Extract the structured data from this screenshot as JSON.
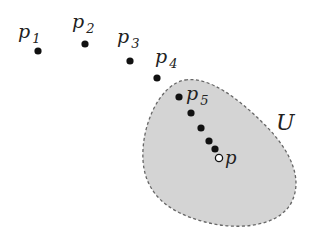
{
  "diagram": {
    "region": {
      "label": "U",
      "fill": "#d4d4d4",
      "stroke": "#666666"
    },
    "points": [
      {
        "name": "p",
        "sub": "1",
        "x": 38,
        "y": 51
      },
      {
        "name": "p",
        "sub": "2",
        "x": 85,
        "y": 44
      },
      {
        "name": "p",
        "sub": "3",
        "x": 130,
        "y": 61
      },
      {
        "name": "p",
        "sub": "4",
        "x": 157,
        "y": 78
      },
      {
        "name": "p",
        "sub": "5",
        "x": 179,
        "y": 97
      }
    ],
    "extra_points": [
      {
        "x": 191,
        "y": 113
      },
      {
        "x": 201,
        "y": 128
      },
      {
        "x": 209,
        "y": 141
      },
      {
        "x": 215,
        "y": 149
      }
    ],
    "limit_point": {
      "name": "p",
      "x": 219,
      "y": 158
    }
  }
}
